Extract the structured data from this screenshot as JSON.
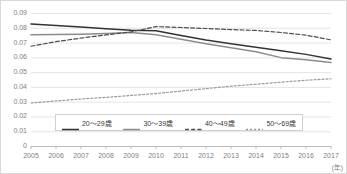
{
  "chart_data": {
    "type": "line",
    "title": "",
    "xlabel": "(年)",
    "ylabel": "",
    "grid": true,
    "legend_position": "inside-bottom-center",
    "xlim": [
      2005,
      2017
    ],
    "ylim": [
      0,
      0.09
    ],
    "x": [
      2005,
      2006,
      2007,
      2008,
      2009,
      2010,
      2011,
      2012,
      2013,
      2014,
      2015,
      2016,
      2017
    ],
    "categories": [
      "2005",
      "2006",
      "2007",
      "2008",
      "2009",
      "2010",
      "2011",
      "2012",
      "2013",
      "2014",
      "2015",
      "2016",
      "2017"
    ],
    "ytick_labels": [
      "0.09",
      "0.08",
      "0.07",
      "0.06",
      "0.05",
      "0.04",
      "0.03",
      "0.02",
      "0.01",
      "0"
    ],
    "ytick_values": [
      0.09,
      0.08,
      0.07,
      0.06,
      0.05,
      0.04,
      0.03,
      0.02,
      0.01,
      0
    ],
    "series": [
      {
        "name": "20〜29歳",
        "style": "solid",
        "color": "#333333",
        "values": [
          0.0825,
          0.0815,
          0.0805,
          0.0793,
          0.0783,
          0.078,
          0.0748,
          0.0718,
          0.0692,
          0.0668,
          0.0645,
          0.062,
          0.0588
        ]
      },
      {
        "name": "30〜39歳",
        "style": "solid",
        "color": "#8c8c8c",
        "values": [
          0.0752,
          0.0754,
          0.0757,
          0.0762,
          0.0768,
          0.0753,
          0.0722,
          0.0692,
          0.0665,
          0.0638,
          0.0598,
          0.0583,
          0.0565
        ]
      },
      {
        "name": "40〜49歳",
        "style": "dashed",
        "color": "#4d4d4d",
        "values": [
          0.0675,
          0.0706,
          0.073,
          0.0752,
          0.0772,
          0.0808,
          0.0802,
          0.0795,
          0.0788,
          0.0782,
          0.0768,
          0.075,
          0.0718
        ]
      },
      {
        "name": "50〜69歳",
        "style": "dotted",
        "color": "#999999",
        "values": [
          0.0291,
          0.0305,
          0.0318,
          0.0329,
          0.0342,
          0.0355,
          0.0372,
          0.0388,
          0.0405,
          0.0418,
          0.0432,
          0.0445,
          0.0455
        ]
      }
    ]
  },
  "axis": {
    "unit_label": "(年)"
  },
  "legend": {
    "items": [
      {
        "label": "20〜29歳"
      },
      {
        "label": "30〜39歳"
      },
      {
        "label": "40〜49歳"
      },
      {
        "label": "50〜69歳"
      }
    ]
  }
}
